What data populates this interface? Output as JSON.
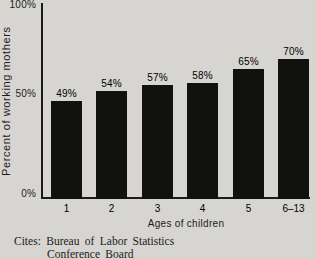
{
  "chart_data": {
    "type": "bar",
    "title": "",
    "categories": [
      "1",
      "2",
      "3",
      "4",
      "5",
      "6–13"
    ],
    "values": [
      49,
      54,
      57,
      58,
      65,
      70
    ],
    "value_labels": [
      "49%",
      "54%",
      "57%",
      "58%",
      "65%",
      "70%"
    ],
    "xlabel": "Ages of children",
    "ylabel": "Percent of working mothers",
    "y_tick_labels": [
      "0%",
      "50%",
      "100%"
    ],
    "y_tick_values": [
      0,
      50,
      100
    ],
    "ylim": [
      0,
      100
    ],
    "grid": false,
    "legend": null,
    "colors": {
      "bar": "#111110",
      "axis": "#1b1b1a",
      "text": "#1c1c1b",
      "background": "#d6d5d1"
    }
  },
  "citation": {
    "line1": "Cites: Bureau of Labor Statistics",
    "line2": "Conference Board"
  }
}
